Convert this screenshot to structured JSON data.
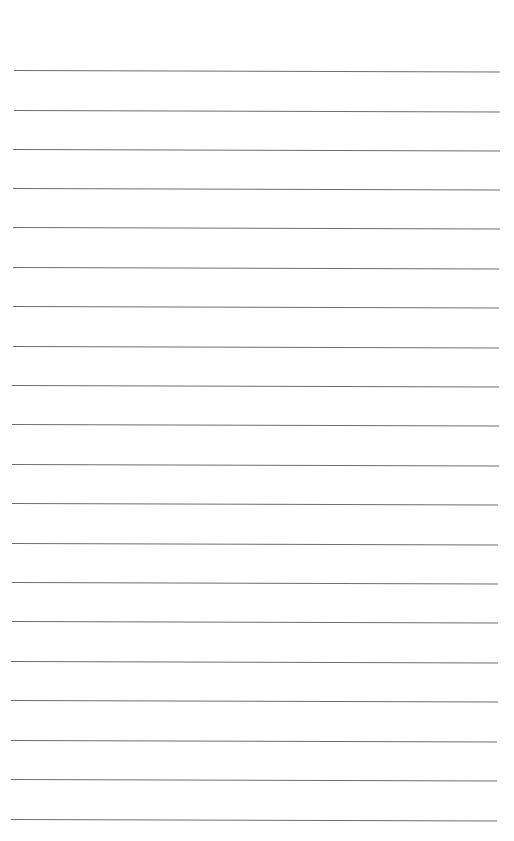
{
  "page": {
    "type": "ruled-sheet",
    "background_color": "#ffffff",
    "line_color": "#6e6e6e",
    "text": "",
    "line_count": 20,
    "lines": [
      {
        "y": 70,
        "x1": 14,
        "x2": 500
      },
      {
        "y": 110,
        "x1": 14,
        "x2": 500
      },
      {
        "y": 149,
        "x1": 13,
        "x2": 500
      },
      {
        "y": 188,
        "x1": 13,
        "x2": 500
      },
      {
        "y": 227,
        "x1": 13,
        "x2": 500
      },
      {
        "y": 267,
        "x1": 13,
        "x2": 499
      },
      {
        "y": 306,
        "x1": 13,
        "x2": 499
      },
      {
        "y": 346,
        "x1": 13,
        "x2": 499
      },
      {
        "y": 385,
        "x1": 12,
        "x2": 499
      },
      {
        "y": 424,
        "x1": 12,
        "x2": 499
      },
      {
        "y": 464,
        "x1": 12,
        "x2": 499
      },
      {
        "y": 503,
        "x1": 12,
        "x2": 498
      },
      {
        "y": 543,
        "x1": 12,
        "x2": 498
      },
      {
        "y": 582,
        "x1": 12,
        "x2": 498
      },
      {
        "y": 621,
        "x1": 12,
        "x2": 498
      },
      {
        "y": 661,
        "x1": 11,
        "x2": 498
      },
      {
        "y": 700,
        "x1": 11,
        "x2": 498
      },
      {
        "y": 740,
        "x1": 11,
        "x2": 497
      },
      {
        "y": 779,
        "x1": 11,
        "x2": 497
      },
      {
        "y": 819,
        "x1": 11,
        "x2": 497
      }
    ]
  }
}
